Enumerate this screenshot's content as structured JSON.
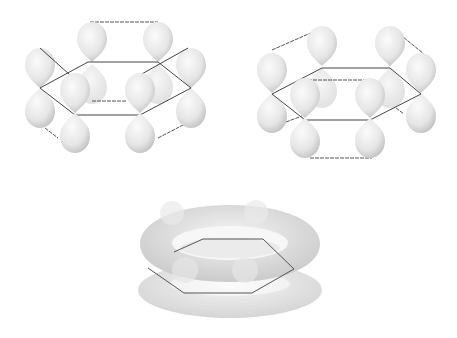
{
  "figure": {
    "panels": [
      {
        "id": "kekule-left",
        "label": ""
      },
      {
        "id": "kekule-right",
        "label": ""
      },
      {
        "id": "delocalized-cloud",
        "label": ""
      }
    ],
    "colors": {
      "background": "#ffffff",
      "lobe_light": "#f4f4f4",
      "lobe_dark": "#b8b8b8",
      "bond_line": "#444444",
      "dashed_line": "#555555"
    }
  }
}
